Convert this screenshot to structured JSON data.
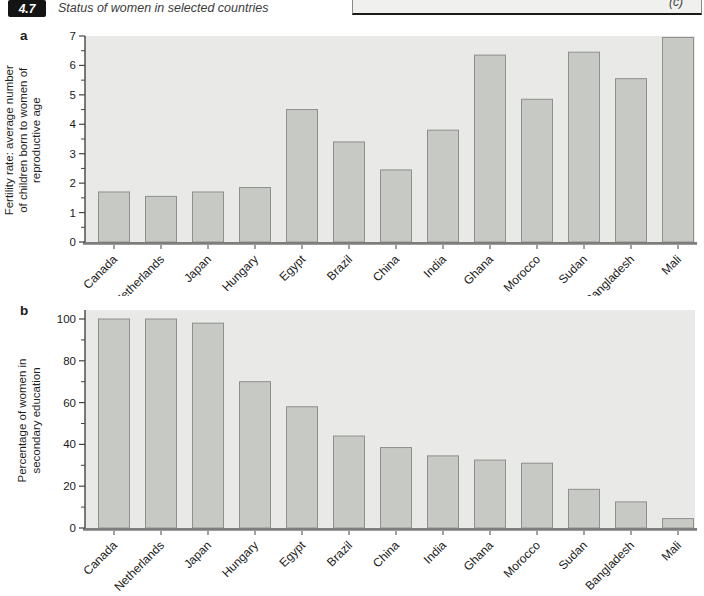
{
  "header": {
    "figure_number": "4.7",
    "title": "Status of women in selected countries"
  },
  "cutoff_panel": {
    "label": "(c)"
  },
  "colors": {
    "header_box_bg": "#141414",
    "header_box_text": "#ffffff",
    "plot_bg": "#e9e9e7",
    "bar_fill": "#c7c9c4",
    "bar_stroke": "#8e908d",
    "axis_line": "#444444",
    "baseline": "#7d7d7b",
    "tick_text": "#1a1a1a"
  },
  "chart_data": [
    {
      "type": "bar",
      "panel": "a",
      "title": "",
      "xlabel": "",
      "ylabel": "Fertility rate: average number\nof children born to women of\nreproductive age",
      "categories": [
        "Canada",
        "Netherlands",
        "Japan",
        "Hungary",
        "Egypt",
        "Brazil",
        "China",
        "India",
        "Ghana",
        "Morocco",
        "Sudan",
        "Bangladesh",
        "Mali"
      ],
      "values": [
        1.7,
        1.55,
        1.7,
        1.85,
        4.5,
        3.4,
        2.45,
        3.8,
        6.35,
        4.85,
        6.45,
        5.55,
        6.95
      ],
      "ylim": [
        0,
        7
      ],
      "ytick_step": 1,
      "minor_tick_step": 0.5,
      "grid": false,
      "legend": false
    },
    {
      "type": "bar",
      "panel": "b",
      "title": "",
      "xlabel": "",
      "ylabel": "Percentage of women in\nsecondary education",
      "categories": [
        "Canada",
        "Netherlands",
        "Japan",
        "Hungary",
        "Egypt",
        "Brazil",
        "China",
        "India",
        "Ghana",
        "Morocco",
        "Sudan",
        "Bangladesh",
        "Mali"
      ],
      "values": [
        100,
        100,
        98,
        70,
        58,
        44,
        38.5,
        34.5,
        32.5,
        31,
        18.5,
        12.5,
        4.5
      ],
      "ylim": [
        0,
        100
      ],
      "ytick_step": 20,
      "minor_tick_step": 10,
      "grid": false,
      "legend": false
    }
  ]
}
